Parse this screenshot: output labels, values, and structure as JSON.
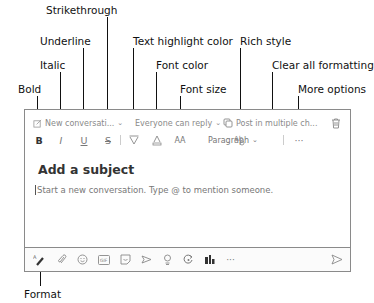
{
  "callouts": {
    "bold": "Bold",
    "italic": "Italic",
    "underline": "Underline",
    "strikethrough": "Strikethrough",
    "text_highlight": "Text highlight color",
    "font_color": "Font color",
    "font_size": "Font size",
    "rich_style": "Rich style",
    "clear_formatting": "Clear all formatting",
    "more_options": "More options",
    "format": "Format"
  },
  "header_row": {
    "post_type": "New conversati...",
    "reply_setting": "Everyone can reply",
    "post_multiple": "Post in multiple ch..."
  },
  "format_toolbar": {
    "bold_glyph": "B",
    "italic_glyph": "I",
    "underline_glyph": "U",
    "strike_glyph": "S",
    "font_size_glyph": "AA",
    "paragraph": "Paragraph",
    "more_glyph": "···"
  },
  "composer": {
    "subject_placeholder": "Add a subject",
    "body_placeholder": "Start a new conversation. Type @ to mention someone."
  },
  "bottom_toolbar": {
    "icons": [
      "format-icon",
      "attach-icon",
      "emoji-icon",
      "gif-icon",
      "sticker-icon",
      "loop-icon",
      "praise-icon",
      "approvals-icon",
      "updates-icon",
      "more-icon",
      "send-icon"
    ],
    "more_glyph": "···"
  }
}
